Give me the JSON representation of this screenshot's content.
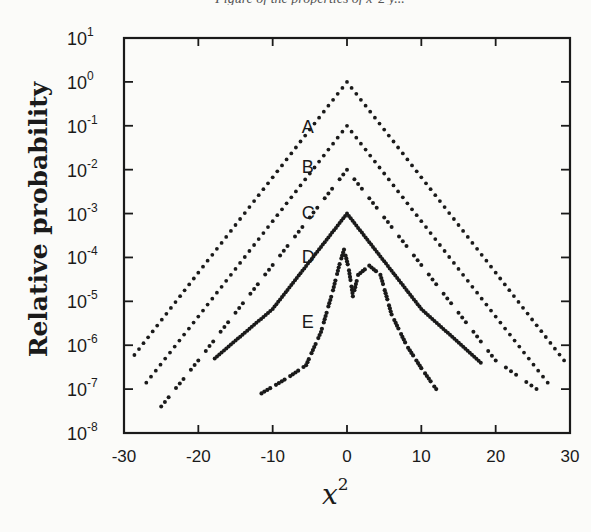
{
  "chart_data": {
    "type": "scatter",
    "title": "",
    "xlabel": "x^2",
    "xlabel_base": "x",
    "xlabel_exp": "2",
    "ylabel": "Relative probability",
    "xlim": [
      -30,
      30
    ],
    "ylim": [
      1e-08,
      10
    ],
    "yscale": "log",
    "grid": false,
    "legend": "none (curves labeled inline A-E)",
    "x_ticks": [
      "-30",
      "-20",
      "-10",
      "0",
      "10",
      "20",
      "30"
    ],
    "y_ticks": [
      {
        "base": "10",
        "exp": "1"
      },
      {
        "base": "10",
        "exp": "0"
      },
      {
        "base": "10",
        "exp": "-1"
      },
      {
        "base": "10",
        "exp": "-2"
      },
      {
        "base": "10",
        "exp": "-3"
      },
      {
        "base": "10",
        "exp": "-4"
      },
      {
        "base": "10",
        "exp": "-5"
      },
      {
        "base": "10",
        "exp": "-6"
      },
      {
        "base": "10",
        "exp": "-7"
      },
      {
        "base": "10",
        "exp": "-8"
      }
    ],
    "series": [
      {
        "name": "A",
        "style": "dotted",
        "peak_x": 0,
        "peak_y": 1.0,
        "x": [
          -28.6,
          -20,
          -10,
          0,
          10,
          20,
          29.2
        ],
        "y": [
          6e-07,
          4.5e-05,
          0.0067,
          1.0,
          0.0067,
          4.5e-05,
          4.5e-07
        ]
      },
      {
        "name": "B",
        "style": "dotted",
        "peak_x": 0,
        "peak_y": 0.1,
        "x": [
          -27.0,
          -20,
          -10,
          0,
          10,
          20,
          27.0
        ],
        "y": [
          1.4e-07,
          4.5e-06,
          0.00067,
          0.1,
          0.00067,
          4.5e-06,
          1.4e-07
        ]
      },
      {
        "name": "C",
        "style": "dashed-dotted",
        "peak_x": 0,
        "peak_y": 0.01,
        "x": [
          -25.0,
          -20,
          -10,
          0,
          10,
          20,
          25.5
        ],
        "y": [
          4e-08,
          4.5e-07,
          6.7e-05,
          0.01,
          6.7e-05,
          4.5e-07,
          1e-07
        ]
      },
      {
        "name": "D",
        "style": "solid-dots",
        "peak_x": 0,
        "peak_y": 0.001,
        "x": [
          -17.8,
          -10,
          0,
          10,
          18.0
        ],
        "y": [
          5e-07,
          6.7e-06,
          0.001,
          6.7e-06,
          4e-07
        ]
      },
      {
        "name": "E",
        "style": "dashed",
        "peak_x": -0.4,
        "peak_y": 0.00015,
        "x": [
          -11.5,
          -8,
          -5.5,
          -3.5,
          -2,
          -1,
          -0.4,
          0.2,
          0.8,
          1.5,
          3.0,
          4.5,
          6,
          8,
          10,
          12
        ],
        "y": [
          8e-08,
          1.8e-07,
          3.5e-07,
          2e-06,
          1.5e-05,
          7e-05,
          0.00015,
          6e-05,
          1.3e-05,
          4e-05,
          6.5e-05,
          4e-05,
          5e-06,
          1e-06,
          3e-07,
          1e-07
        ]
      }
    ],
    "annotations": [
      {
        "text": "A",
        "x": -5,
        "y": 0.1
      },
      {
        "text": "B",
        "x": -5,
        "y": 0.012
      },
      {
        "text": "C",
        "x": -5,
        "y": 0.0011
      },
      {
        "text": "D",
        "x": -5,
        "y": 0.00011
      },
      {
        "text": "E",
        "x": -5,
        "y": 3.5e-06
      }
    ],
    "colors": {
      "ink": "#1a1a1a",
      "background": "#fbfbf9"
    }
  },
  "page": {
    "top_caption": "Figure of the properties of x^2 y..."
  }
}
